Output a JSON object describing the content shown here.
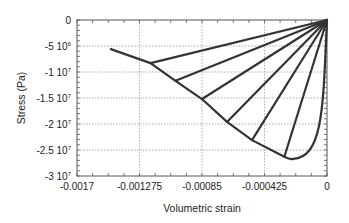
{
  "chart_data": {
    "type": "line",
    "title": "",
    "xlabel": "Volumetric strain",
    "ylabel": "Stress (Pa)",
    "xlim": [
      -0.0017,
      0
    ],
    "ylim": [
      -30000000,
      0
    ],
    "grid": true,
    "x_ticks": [
      "-0.0017",
      "-0.001275",
      "-0.00085",
      "-0.000425",
      "0"
    ],
    "y_ticks": [
      {
        "value": 0,
        "label": "0",
        "exp": ""
      },
      {
        "value": -5000000,
        "label": "-5 10",
        "exp": "6"
      },
      {
        "value": -10000000,
        "label": "-1 10",
        "exp": "7"
      },
      {
        "value": -15000000,
        "label": "-1.5 10",
        "exp": "7"
      },
      {
        "value": -20000000,
        "label": "-2 10",
        "exp": "7"
      },
      {
        "value": -25000000,
        "label": "-2.5 10",
        "exp": "7"
      },
      {
        "value": -30000000,
        "label": "-3 10",
        "exp": "7"
      }
    ],
    "series": [
      {
        "name": "envelope",
        "x": [
          -0.00147,
          -0.0012,
          -0.00103,
          -0.00085,
          -0.00068,
          -0.00051,
          -0.00029,
          -0.00023,
          -0.00012,
          -4e-05,
          0
        ],
        "y": [
          -5600000,
          -8300000,
          -11700000,
          -15200000,
          -19600000,
          -23100000,
          -26300000,
          -26700000,
          -24000000,
          -15000000,
          0
        ]
      },
      {
        "name": "unload-1",
        "x": [
          -0.0012,
          0
        ],
        "y": [
          -8300000,
          0
        ]
      },
      {
        "name": "unload-2",
        "x": [
          -0.00103,
          0
        ],
        "y": [
          -11700000,
          0
        ]
      },
      {
        "name": "unload-3",
        "x": [
          -0.00085,
          0
        ],
        "y": [
          -15200000,
          0
        ]
      },
      {
        "name": "unload-4",
        "x": [
          -0.00068,
          0
        ],
        "y": [
          -19600000,
          0
        ]
      },
      {
        "name": "unload-5",
        "x": [
          -0.00051,
          0
        ],
        "y": [
          -23100000,
          0
        ]
      },
      {
        "name": "unload-6",
        "x": [
          -0.00029,
          0
        ],
        "y": [
          -26300000,
          0
        ]
      }
    ]
  }
}
